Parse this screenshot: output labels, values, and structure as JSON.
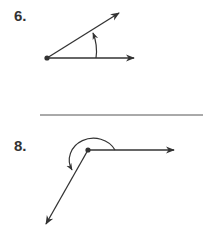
{
  "problems": [
    {
      "number": "6.",
      "description": "Angle with vertex, counterclockwise arc from horizontal ray to upper ray (acute angle)"
    },
    {
      "number": "8.",
      "description": "Angle with vertex, counterclockwise reflex arc from horizontal ray around to lower-left ray"
    }
  ],
  "colors": {
    "ink": "#333333"
  }
}
